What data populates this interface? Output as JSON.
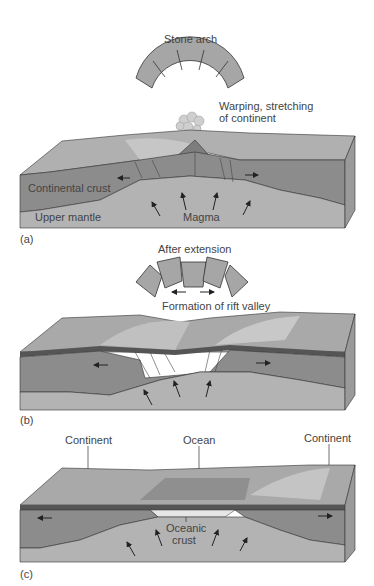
{
  "figure": {
    "panels": [
      {
        "id": "a",
        "panel_label": "(a)",
        "arch_title": "Stone arch",
        "annotation_line1": "Warping, stretching",
        "annotation_line2": "of continent",
        "crust_label": "Continental crust",
        "mantle_label": "Upper mantle",
        "magma_label": "Magma"
      },
      {
        "id": "b",
        "panel_label": "(b)",
        "arch_title": "After extension",
        "annotation": "Formation of rift valley"
      },
      {
        "id": "c",
        "panel_label": "(c)",
        "left_label": "Continent",
        "center_label": "Ocean",
        "right_label": "Continent",
        "oceanic_line1": "Oceanic",
        "oceanic_line2": "crust"
      }
    ],
    "colors": {
      "surface": "#a9a9a9",
      "surface_light": "#c4c4c4",
      "crust": "#8c8c8c",
      "mantle": "#b3b3b3",
      "side": "#9a9a9a",
      "arch_block": "#a6a6a6",
      "outline": "#333333",
      "oceanic_crust": "#e6e6e6"
    }
  }
}
